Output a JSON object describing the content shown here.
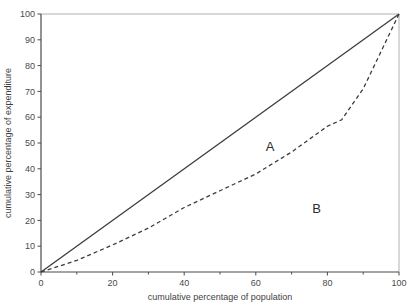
{
  "chart_data": {
    "type": "line",
    "title": "",
    "xlabel": "cumulative percentage of population",
    "ylabel": "cumulative percentage of expenditure",
    "xlim": [
      0,
      100
    ],
    "ylim": [
      0,
      100
    ],
    "xticks": [
      0,
      20,
      40,
      60,
      80,
      100
    ],
    "yticks": [
      0,
      10,
      20,
      30,
      40,
      50,
      60,
      70,
      80,
      90,
      100
    ],
    "xtick_labels": [
      "0",
      "20",
      "40",
      "60",
      "80",
      "100"
    ],
    "ytick_labels": [
      "0",
      "10",
      "20",
      "30",
      "40",
      "50",
      "60",
      "70",
      "80",
      "90",
      "100"
    ],
    "minor_xtick_step": 10,
    "minor_ytick_step": 10,
    "grid": false,
    "legend": "none",
    "series": [
      {
        "name": "line of equality",
        "style": "solid",
        "color": "#3c3c3c",
        "x": [
          0,
          100
        ],
        "values": [
          0,
          100
        ]
      },
      {
        "name": "Lorenz curve",
        "style": "dashed",
        "color": "#3c3c3c",
        "x": [
          0,
          10,
          20,
          30,
          40,
          50,
          60,
          70,
          80,
          84,
          90,
          100
        ],
        "values": [
          0,
          4.5,
          10.5,
          17.0,
          25.0,
          31.5,
          38.0,
          46.5,
          56.5,
          59.0,
          71.0,
          100
        ]
      }
    ],
    "annotations": [
      {
        "text": "A",
        "x": 64,
        "y": 47
      },
      {
        "text": "B",
        "x": 77,
        "y": 23
      }
    ]
  },
  "axes": {
    "x_title": "cumulative percentage of population",
    "y_title": "cumulative percentage of expenditure"
  },
  "colors": {
    "axis": "#4a4a4a",
    "frame": "#b0b0b0",
    "curve": "#3c3c3c",
    "text": "#3a3a3a",
    "background": "#ffffff"
  }
}
